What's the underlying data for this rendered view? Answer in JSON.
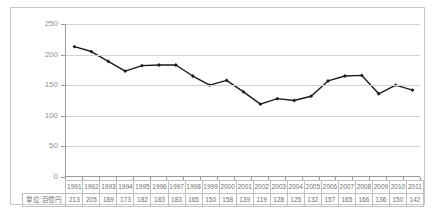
{
  "chart_title": "",
  "chart_data": {
    "type": "line",
    "title": "",
    "xlabel": "",
    "ylabel": "",
    "unit_label": "単位:百億円",
    "ylim": [
      0,
      250
    ],
    "yticks": [
      0,
      50,
      100,
      150,
      200,
      250
    ],
    "grid": true,
    "legend": "none",
    "series_color": "#1a1a1a",
    "marker": "diamond",
    "categories": [
      "1991",
      "1992",
      "1993",
      "1994",
      "1995",
      "1996",
      "1997",
      "1998",
      "1999",
      "2000",
      "2001",
      "2002",
      "2003",
      "2004",
      "2005",
      "2006",
      "2007",
      "2008",
      "2009",
      "2010",
      "2011"
    ],
    "values": [
      213,
      205,
      189,
      173,
      182,
      183,
      183,
      165,
      150,
      158,
      139,
      119,
      128,
      125,
      132,
      157,
      165,
      166,
      136,
      150,
      142
    ],
    "series": [
      {
        "name": "",
        "values": [
          213,
          205,
          189,
          173,
          182,
          183,
          183,
          165,
          150,
          158,
          139,
          119,
          128,
          125,
          132,
          157,
          165,
          166,
          136,
          150,
          142
        ]
      }
    ]
  },
  "table": {
    "row_header": "単位:百億円",
    "years": [
      "1991",
      "1992",
      "1993",
      "1994",
      "1995",
      "1996",
      "1997",
      "1998",
      "1999",
      "2000",
      "2001",
      "2002",
      "2003",
      "2004",
      "2005",
      "2006",
      "2007",
      "2008",
      "2009",
      "2010",
      "2011"
    ],
    "values": [
      "213",
      "205",
      "189",
      "173",
      "182",
      "183",
      "183",
      "165",
      "150",
      "158",
      "139",
      "119",
      "128",
      "125",
      "132",
      "157",
      "165",
      "166",
      "136",
      "150",
      "142"
    ]
  }
}
